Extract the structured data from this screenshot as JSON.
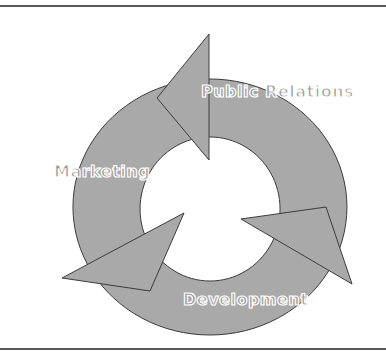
{
  "diagram": {
    "type": "cycle",
    "colors": {
      "fill": "#a9a9a9",
      "outline": "#3c3c3c",
      "rule": "#5a5a5a",
      "label_text": "#a0a0a0",
      "label_outline": "#ffffff"
    },
    "stages": [
      {
        "label": "Public Relations",
        "position": "top-right"
      },
      {
        "label": "Marketing",
        "position": "left"
      },
      {
        "label": "Development",
        "position": "bottom"
      }
    ]
  }
}
